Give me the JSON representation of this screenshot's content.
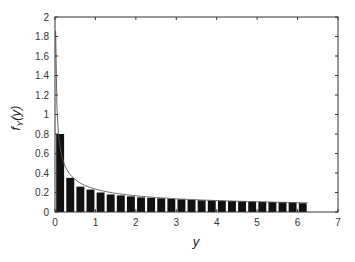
{
  "chart_data": {
    "type": "bar",
    "title": "",
    "xlabel": "y",
    "ylabel": "f_Y(y)",
    "xlim": [
      0,
      7
    ],
    "ylim": [
      0,
      2
    ],
    "xticks": [
      0,
      1,
      2,
      3,
      4,
      5,
      6,
      7
    ],
    "yticks": [
      0,
      0.2,
      0.4,
      0.6,
      0.8,
      1,
      1.2,
      1.4,
      1.6,
      1.8,
      2
    ],
    "grid": false,
    "legend": null,
    "bin_width": 0.25,
    "bin_starts": [
      0,
      0.25,
      0.5,
      0.75,
      1.0,
      1.25,
      1.5,
      1.75,
      2.0,
      2.25,
      2.5,
      2.75,
      3.0,
      3.25,
      3.5,
      3.75,
      4.0,
      4.25,
      4.5,
      4.75,
      5.0,
      5.25,
      5.5,
      5.75,
      6.0
    ],
    "values": [
      0.8,
      0.35,
      0.26,
      0.23,
      0.2,
      0.18,
      0.17,
      0.16,
      0.15,
      0.145,
      0.14,
      0.135,
      0.13,
      0.125,
      0.12,
      0.118,
      0.115,
      0.112,
      0.11,
      0.107,
      0.105,
      0.102,
      0.1,
      0.098,
      0.09
    ],
    "series": [
      {
        "name": "histogram",
        "type": "bar"
      },
      {
        "name": "density curve",
        "type": "line",
        "description": "smooth decreasing curve f_Y(y), rising toward 2 as y approaches 0"
      }
    ]
  }
}
